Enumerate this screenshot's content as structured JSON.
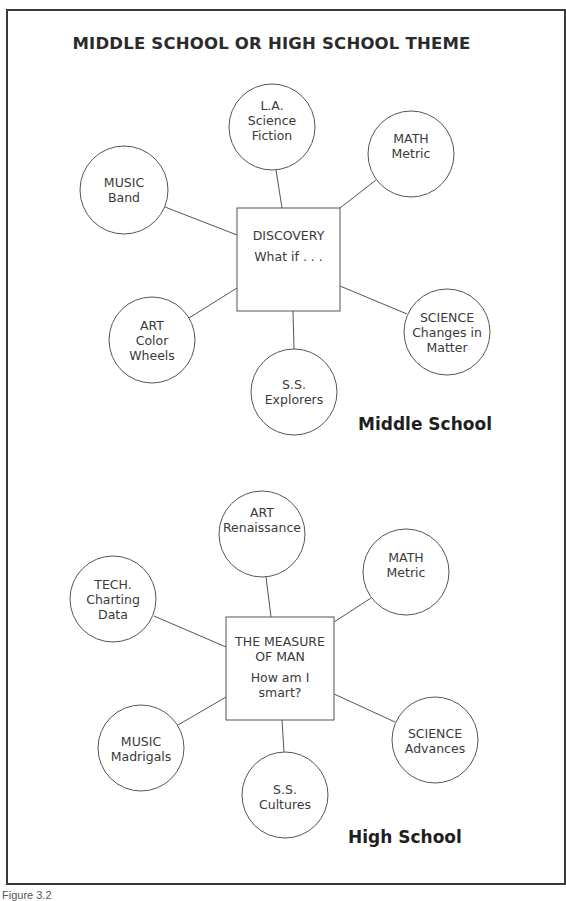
{
  "title": "MIDDLE SCHOOL OR HIGH SCHOOL THEME",
  "caption": "Figure 3.2",
  "style": {
    "line_color": "#555555",
    "text_color": "#3a3a3a",
    "frame_color": "#3a3a3a"
  },
  "middle_school": {
    "label": "Middle School",
    "center": {
      "title": "DISCOVERY",
      "subtitle": "What if . . ."
    },
    "nodes": [
      {
        "id": "la",
        "subject": "L.A.",
        "lines": [
          "Science",
          "Fiction"
        ]
      },
      {
        "id": "math",
        "subject": "MATH",
        "lines": [
          "Metric"
        ]
      },
      {
        "id": "music",
        "subject": "MUSIC",
        "lines": [
          "Band"
        ]
      },
      {
        "id": "art",
        "subject": "ART",
        "lines": [
          "Color",
          "Wheels"
        ]
      },
      {
        "id": "ss",
        "subject": "S.S.",
        "lines": [
          "Explorers"
        ]
      },
      {
        "id": "science",
        "subject": "SCIENCE",
        "lines": [
          "Changes in",
          "Matter"
        ]
      }
    ]
  },
  "high_school": {
    "label": "High School",
    "center": {
      "title_line1": "THE MEASURE",
      "title_line2": "OF MAN",
      "subtitle_line1": "How am I",
      "subtitle_line2": "smart?"
    },
    "nodes": [
      {
        "id": "art",
        "subject": "ART",
        "lines": [
          "Renaissance"
        ]
      },
      {
        "id": "math",
        "subject": "MATH",
        "lines": [
          "Metric"
        ]
      },
      {
        "id": "tech",
        "subject": "TECH.",
        "lines": [
          "Charting",
          "Data"
        ]
      },
      {
        "id": "music",
        "subject": "MUSIC",
        "lines": [
          "Madrigals"
        ]
      },
      {
        "id": "ss",
        "subject": "S.S.",
        "lines": [
          "Cultures"
        ]
      },
      {
        "id": "science",
        "subject": "SCIENCE",
        "lines": [
          "Advances"
        ]
      }
    ]
  }
}
